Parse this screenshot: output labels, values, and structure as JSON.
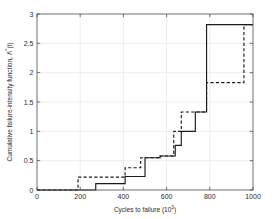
{
  "chart_data": {
    "type": "line",
    "title": "",
    "subtitle": "",
    "xlabel": "Cycles to failure (10",
    "xlabel_exponent": "3",
    "xlabel_suffix": ")",
    "ylabel": "Cumulative failure-intensity function,",
    "ylabel_symbol": "Λ",
    "ylabel_symbol_sup": "^",
    "ylabel_symbol_arg": "(t)",
    "xlim": [
      0,
      1000
    ],
    "ylim": [
      0,
      3
    ],
    "xticks": [
      0,
      200,
      400,
      600,
      800,
      1000
    ],
    "yticks": [
      0,
      0.5,
      1,
      1.5,
      2,
      2.5,
      3
    ],
    "xticklabels": [
      "0",
      "200",
      "400",
      "600",
      "800",
      "1000"
    ],
    "yticklabels": [
      "0",
      "0.5",
      "1",
      "1.5",
      "2",
      "2.5",
      "3"
    ],
    "grid": true,
    "grid_color": "#e6e6e6",
    "axis_color": "#4d4d4d",
    "legend": null,
    "legend_position": "none",
    "series": [
      {
        "name": "solid-step",
        "style": "solid",
        "color": "#1a1a1a",
        "drawstyle": "steps-post",
        "x": [
          0,
          272,
          272,
          408,
          408,
          500,
          500,
          570,
          570,
          640,
          640,
          668,
          668,
          733,
          733,
          785,
          785,
          1000
        ],
        "y": [
          0,
          0,
          0.11,
          0.11,
          0.23,
          0.23,
          0.55,
          0.55,
          0.58,
          0.58,
          0.76,
          0.76,
          1.0,
          1.0,
          1.33,
          1.33,
          2.82,
          2.82
        ]
      },
      {
        "name": "dashed-step",
        "style": "dashed",
        "color": "#1a1a1a",
        "drawstyle": "steps-post",
        "x": [
          0,
          190,
          190,
          408,
          408,
          480,
          480,
          570,
          570,
          633,
          633,
          668,
          668,
          785,
          785,
          958,
          958,
          1000
        ],
        "y": [
          0,
          0,
          0.22,
          0.22,
          0.38,
          0.38,
          0.55,
          0.55,
          0.58,
          0.58,
          1.0,
          1.0,
          1.33,
          1.33,
          1.83,
          1.83,
          2.82,
          2.82
        ]
      }
    ]
  },
  "figure": {
    "background": "#ffffff",
    "plot_background": "#ffffff"
  }
}
